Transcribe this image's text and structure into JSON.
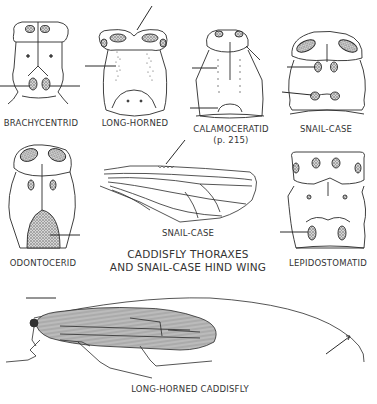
{
  "figure": {
    "title_line1": "CADDISFLY THORAXES",
    "title_line2": "AND SNAIL-CASE HIND WING"
  },
  "thoraxes": [
    {
      "id": "brachycentrid",
      "label": "BRACHYCENTRID"
    },
    {
      "id": "long-horned",
      "label": "LONG-HORNED"
    },
    {
      "id": "calamoceratid",
      "label": "CALAMOCERATID",
      "sublabel": "(p. 215)"
    },
    {
      "id": "snail-case",
      "label": "SNAIL-CASE"
    },
    {
      "id": "odontocerid",
      "label": "ODONTOCERID"
    },
    {
      "id": "lepidostomatid",
      "label": "LEPIDOSTOMATID"
    }
  ],
  "hind_wing": {
    "label": "SNAIL-CASE"
  },
  "adult": {
    "label": "LONG-HORNED CADDISFLY"
  },
  "colors": {
    "ink": "#2a2a2a",
    "stipple_fill": "#9a9a9a",
    "background": "#ffffff"
  }
}
